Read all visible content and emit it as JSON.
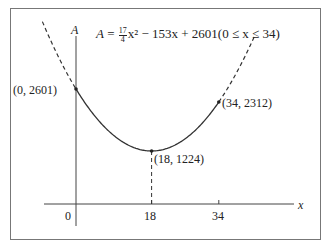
{
  "chart_data": {
    "type": "line",
    "formula": {
      "lhs": "A",
      "eq": "=",
      "coef_num": "17",
      "coef_den": "4",
      "rest": "x² − 153x + 2601(0 ≤ x ≤ 34)"
    },
    "xlabel": "x",
    "ylabel": "A",
    "x_ticks": [
      "0",
      "18",
      "34"
    ],
    "xlim": [
      -8,
      52
    ],
    "domain": [
      0,
      34
    ],
    "series": [
      {
        "name": "A(x)",
        "x": [
          0,
          2,
          4,
          6,
          8,
          10,
          12,
          14,
          16,
          18,
          20,
          22,
          24,
          26,
          28,
          30,
          32,
          34
        ],
        "values": [
          2601,
          2312,
          2057,
          1836,
          1649,
          1496,
          1377,
          1292,
          1241,
          1224,
          1241,
          1292,
          1377,
          1496,
          1649,
          1836,
          2057,
          2312
        ]
      }
    ],
    "annotations": [
      {
        "label": "(0, 2601)",
        "x": 0,
        "y": 2601
      },
      {
        "label": "(18, 1224)",
        "x": 18,
        "y": 1224
      },
      {
        "label": "(34, 2312)",
        "x": 34,
        "y": 2312
      }
    ],
    "dashed_extensions": true,
    "vertical_dashed_at": 18,
    "grid": false,
    "legend": "none"
  }
}
